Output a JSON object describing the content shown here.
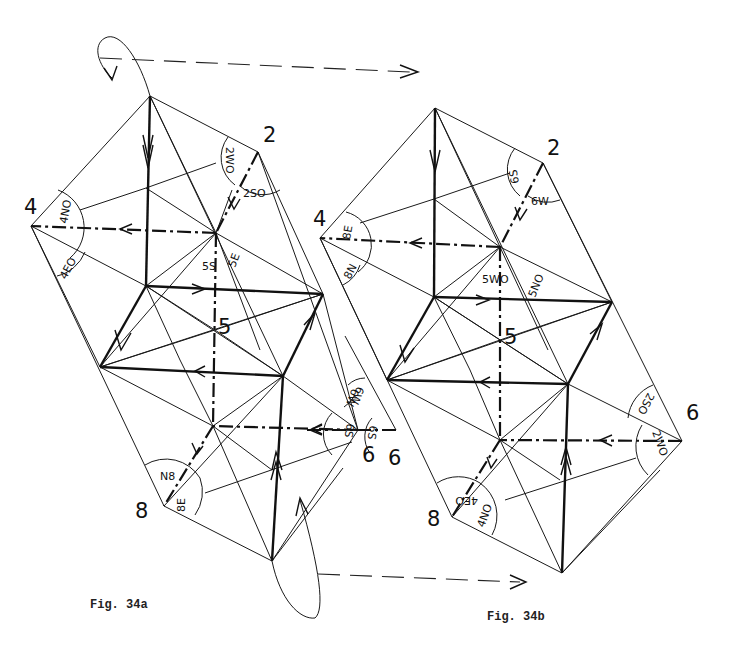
{
  "figures": [
    {
      "id": "fig34a",
      "caption": "Fig. 34a",
      "vertex_labels": {
        "v2": "2",
        "v4": "4",
        "v5": "5",
        "v6": "6",
        "v8": "8"
      },
      "angle_labels": {
        "at2_a": "2WO",
        "at2_b": "2SO",
        "at4_a": "4NO",
        "at4_b": "4EO",
        "at5_a": "5S",
        "at5_b": "5E",
        "at6_a": "6W",
        "at6_b": "6S",
        "at8_a": "N8",
        "at8_b": "8E"
      }
    },
    {
      "id": "fig34b",
      "caption": "Fig. 34b",
      "vertex_labels": {
        "v2": "2",
        "v4": "4",
        "v5": "5",
        "v6": "6",
        "v8": "8"
      },
      "angle_labels": {
        "at2_a": "6S",
        "at2_b": "6W",
        "at4_a": "8E",
        "at4_b": "8N",
        "at5_a": "5WO",
        "at5_b": "5NO",
        "at6_a": "2SO",
        "at6_b": "2WO",
        "at8_a": "4EO",
        "at8_b": "4NO"
      }
    }
  ],
  "transitions": [
    {
      "id": "top-rotation",
      "description": "rotation arrow from Fig. 34a top to Fig. 34b"
    },
    {
      "id": "bottom-rotation",
      "description": "rotation arrow from Fig. 34a bottom to Fig. 34b"
    }
  ]
}
